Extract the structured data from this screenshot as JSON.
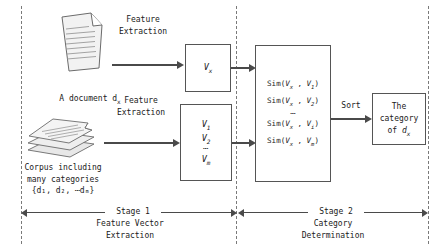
{
  "diagram": {
    "inputs": {
      "single_doc_icon": "document-icon",
      "single_doc_label_prefix": "A document d",
      "single_doc_label_sub": "x",
      "corpus_icon": "stacked-documents-icon",
      "corpus_line1": "Corpus including",
      "corpus_line2": "many categories",
      "corpus_set": "{d₁, d₂, ⋯dₘ}"
    },
    "process_labels": {
      "feature_extraction_top_line1": "Feature",
      "feature_extraction_top_line2": "Extraction",
      "feature_extraction_bottom_line1": "Feature",
      "feature_extraction_bottom_line2": "Extraction",
      "sort": "Sort"
    },
    "boxes": {
      "vx": {
        "symbol": "V",
        "sub": "x"
      },
      "vlist": {
        "items": [
          {
            "symbol": "V",
            "sub": "1"
          },
          {
            "symbol": "V",
            "sub": "2"
          },
          {
            "symbol": "⋯",
            "sub": ""
          },
          {
            "symbol": "V",
            "sub": "m"
          }
        ]
      },
      "similarity": {
        "fn": "Sim",
        "rows": [
          {
            "left": "V",
            "left_sub": "x",
            "right": "V",
            "right_sub": "1"
          },
          {
            "left": "V",
            "left_sub": "x",
            "right": "V",
            "right_sub": "2"
          },
          {
            "ellipsis": "⋯"
          },
          {
            "left": "V",
            "left_sub": "x",
            "right": "V",
            "right_sub": "i"
          },
          {
            "left": "V",
            "left_sub": "x",
            "right": "V",
            "right_sub": "m"
          }
        ]
      },
      "category": {
        "line1": "The",
        "line2": "category",
        "line3_prefix": "of",
        "line3_symbol": "d",
        "line3_sub": "x"
      }
    },
    "stages": [
      {
        "name": "Stage 1",
        "sub_line1": "Feature Vector",
        "sub_line2": "Extraction"
      },
      {
        "name": "Stage 2",
        "sub_line1": "Category",
        "sub_line2": "Determination"
      }
    ],
    "colors": {
      "stroke": "#555555",
      "arrow": "#4a4a4a",
      "divider": "#7a7a7a",
      "paper_fill": "#f2f2f2",
      "background": "#ffffff",
      "text": "#1a1a1a"
    }
  }
}
